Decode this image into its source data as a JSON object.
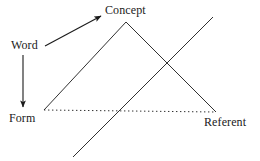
{
  "diagram": {
    "background_color": "#ffffff",
    "stroke_color": "#1a1a1a",
    "text_color": "#1a1a1a",
    "width": 260,
    "height": 161,
    "nodes": [
      {
        "id": "concept",
        "label": "Concept",
        "x": 105,
        "y": 4
      },
      {
        "id": "word",
        "label": "Word",
        "x": 11,
        "y": 39
      },
      {
        "id": "form",
        "label": "Form",
        "x": 9,
        "y": 112
      },
      {
        "id": "referent",
        "label": "Referent",
        "x": 204,
        "y": 116
      }
    ],
    "edges": [
      {
        "id": "word-to-concept",
        "type": "arrow",
        "style": "solid",
        "from": {
          "x": 45,
          "y": 46
        },
        "to": {
          "x": 103,
          "y": 15
        }
      },
      {
        "id": "word-to-form",
        "type": "arrow",
        "style": "solid",
        "from": {
          "x": 23,
          "y": 55
        },
        "to": {
          "x": 23,
          "y": 110
        }
      },
      {
        "id": "form-to-concept",
        "type": "line",
        "style": "solid",
        "from": {
          "x": 44,
          "y": 110
        },
        "to": {
          "x": 126,
          "y": 22
        }
      },
      {
        "id": "concept-to-referent",
        "type": "line",
        "style": "solid",
        "from": {
          "x": 126,
          "y": 22
        },
        "to": {
          "x": 216,
          "y": 112
        }
      },
      {
        "id": "form-to-referent",
        "type": "line",
        "style": "dotted",
        "from": {
          "x": 44,
          "y": 110
        },
        "to": {
          "x": 215,
          "y": 112
        }
      },
      {
        "id": "crossing-diagonal",
        "type": "line",
        "style": "solid",
        "from": {
          "x": 73,
          "y": 157
        },
        "to": {
          "x": 213,
          "y": 17
        }
      }
    ]
  }
}
